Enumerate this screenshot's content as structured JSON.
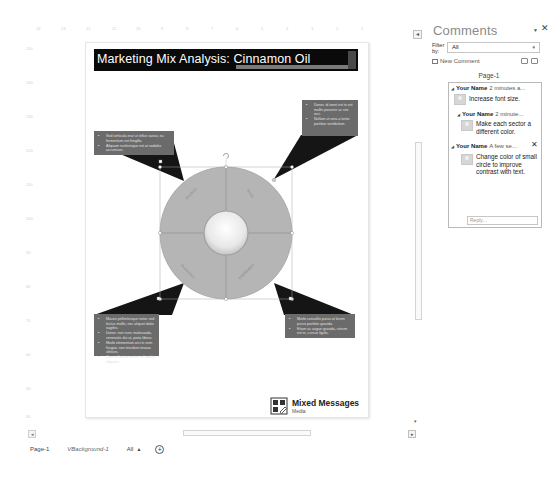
{
  "ruler_horizontal": [
    "14",
    "13",
    "12",
    "11",
    "10",
    "9",
    "8",
    "7",
    "6",
    "5",
    "4",
    "3",
    "2",
    "1",
    "0"
  ],
  "ruler_vertical": [
    "150",
    "140",
    "130",
    "120",
    "110",
    "100",
    "90",
    "80",
    "70",
    "60",
    "50",
    "40",
    "30",
    "20",
    "10",
    "0"
  ],
  "page": {
    "title": "Marketing Mix Analysis: Cinnamon Oil",
    "diagram": {
      "type": "radial-cycle",
      "sectors": [
        "Product",
        "Price",
        "Promotion",
        "Distribution"
      ],
      "sector_color": "#b5b5b5",
      "center_color": "#eeeeee"
    },
    "callouts": {
      "top_left": [
        "Sed vehicula erat ut tellus varius, eu fermentum est fringilla.",
        "Aliquam scelerisque est at sodales accumsan."
      ],
      "top_right": [
        "Donec id amet est in est mollis posuere ac nisi orci.",
        "Nullam ut urna a tortor porttitor vestibulum."
      ],
      "bottom_left": [
        "Mauris pellentesque tortor sed lectus mollis, nec aliquet dolor sagittis.",
        "Donec non nunc malesuada, venenatis dui at, porta libero.",
        "Morbi elementum orci in sem feugiat, non tincidunt massa ultrices.",
        "Cras at lectus metus vel mattis aliquam."
      ],
      "bottom_right": [
        "Morbi convallis purus at lorem purus porttitor gravida.",
        "Etiam ac augue gravida, rutrum est in, cursus ligula."
      ]
    },
    "logo": {
      "name": "Mixed Messages",
      "subtitle": "Media"
    }
  },
  "page_tabs": {
    "tabs": [
      "Page-1",
      "VBackground-1"
    ],
    "all_label": "All",
    "add_label": "+"
  },
  "comments_pane": {
    "title": "Comments",
    "filter_label": "Filter by:",
    "filter_value": "All",
    "new_comment_label": "New Comment",
    "page_label": "Page-1",
    "comments": [
      {
        "author": "Your Name",
        "time": "2 minutes a...",
        "text": "Increase font size."
      },
      {
        "author": "Your Name",
        "time": "2 minute...",
        "text": "Make each sector a different color."
      },
      {
        "author": "Your Name",
        "time": "A few se...",
        "text": "Change color of small circle to improve contrast with text."
      }
    ],
    "reply_placeholder": "Reply..."
  },
  "colors": {
    "title_bg": "#0a0a0a",
    "callout_bg": "#6b6b6b",
    "connector": "#151515",
    "sector": "#b5b5b5"
  }
}
